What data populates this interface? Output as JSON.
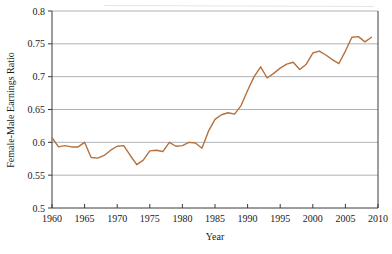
{
  "chart_data": {
    "type": "line",
    "title": "",
    "xlabel": "Year",
    "ylabel": "Female-Male Earnings Ratio",
    "xlim": [
      1960,
      2010
    ],
    "ylim": [
      0.5,
      0.8
    ],
    "grid": true,
    "legend": "none",
    "line_color": "#b5713d",
    "x_ticks": [
      1960,
      1965,
      1970,
      1975,
      1980,
      1985,
      1990,
      1995,
      2000,
      2005,
      2010
    ],
    "x_tick_labels": [
      "1960",
      "1965",
      "1970",
      "1975",
      "1980",
      "1985",
      "1990",
      "1995",
      "2000",
      "2005",
      "2010"
    ],
    "y_ticks": [
      0.5,
      0.55,
      0.6,
      0.65,
      0.7,
      0.75,
      0.8
    ],
    "y_tick_labels": [
      "0.5",
      "0.55",
      "0.6",
      "0.65",
      "0.7",
      "0.75",
      "0.8"
    ],
    "series": [
      {
        "name": "Female-Male Earnings Ratio",
        "color": "#b5713d",
        "x": [
          1960,
          1961,
          1962,
          1963,
          1964,
          1965,
          1966,
          1967,
          1968,
          1969,
          1970,
          1971,
          1972,
          1973,
          1974,
          1975,
          1976,
          1977,
          1978,
          1979,
          1980,
          1981,
          1982,
          1983,
          1984,
          1985,
          1986,
          1987,
          1988,
          1989,
          1990,
          1991,
          1992,
          1993,
          1994,
          1995,
          1996,
          1997,
          1998,
          1999,
          2000,
          2001,
          2002,
          2003,
          2004,
          2005,
          2006,
          2007,
          2008,
          2009
        ],
        "y": [
          0.607,
          0.593,
          0.595,
          0.593,
          0.593,
          0.6,
          0.577,
          0.576,
          0.58,
          0.588,
          0.594,
          0.595,
          0.58,
          0.566,
          0.573,
          0.587,
          0.588,
          0.586,
          0.6,
          0.594,
          0.595,
          0.6,
          0.599,
          0.591,
          0.617,
          0.635,
          0.642,
          0.645,
          0.643,
          0.656,
          0.679,
          0.7,
          0.715,
          0.698,
          0.705,
          0.713,
          0.719,
          0.722,
          0.711,
          0.719,
          0.736,
          0.739,
          0.733,
          0.726,
          0.72,
          0.739,
          0.76,
          0.761,
          0.753,
          0.76
        ]
      }
    ]
  },
  "axes": {
    "x_axis_title": "Year",
    "y_axis_title": "Female-Male Earnings Ratio"
  }
}
